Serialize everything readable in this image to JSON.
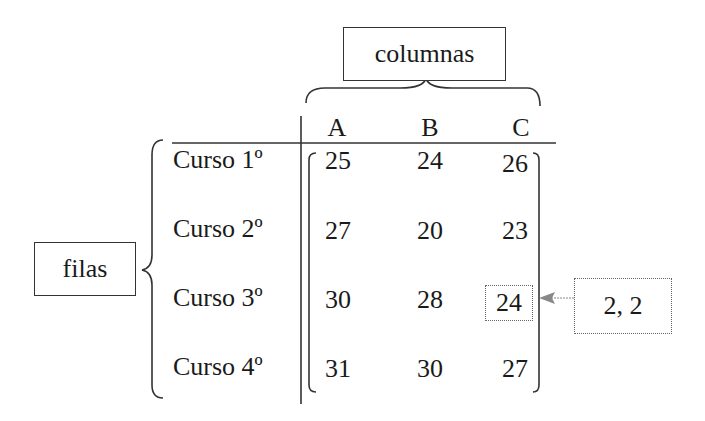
{
  "labels": {
    "columns_label": "columnas",
    "rows_label": "filas",
    "index_label": "2, 2"
  },
  "column_headers": [
    "A",
    "B",
    "C"
  ],
  "row_headers": [
    "Curso 1º",
    "Curso 2º",
    "Curso 3º",
    "Curso 4º"
  ],
  "matrix": [
    [
      "25",
      "24",
      "26"
    ],
    [
      "27",
      "20",
      "23"
    ],
    [
      "30",
      "28",
      "24"
    ],
    [
      "31",
      "30",
      "27"
    ]
  ],
  "highlighted_cell": {
    "row": 2,
    "col": 2,
    "value": "24"
  },
  "colors": {
    "line": "#333333",
    "arrow": "#888888",
    "text": "#1a1a1a"
  }
}
